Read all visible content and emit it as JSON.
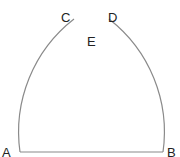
{
  "diagram": {
    "type": "geometric-construction",
    "points": {
      "A": {
        "label": "A"
      },
      "B": {
        "label": "B"
      },
      "C": {
        "label": "C"
      },
      "D": {
        "label": "D"
      },
      "E": {
        "label": "E"
      }
    },
    "colors": {
      "line": "#8a8a8a",
      "text": "#222222"
    }
  }
}
